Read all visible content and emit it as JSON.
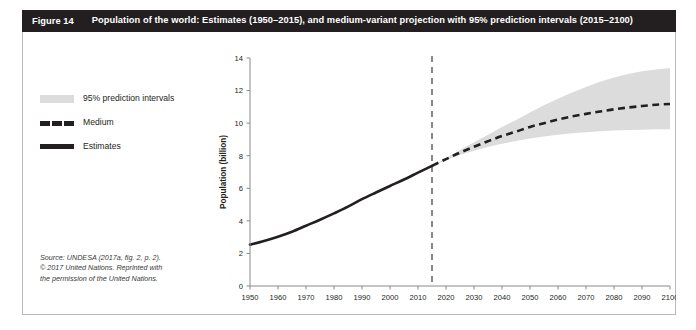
{
  "figure": {
    "number_label": "Figure 14",
    "title": "Population of the world: Estimates (1950–2015), and medium-variant projection with 95% prediction intervals (2015–2100)"
  },
  "legend": {
    "items": [
      {
        "key": "band",
        "label": "95% prediction intervals",
        "swatch": "filled-rectangle",
        "color": "#dcdcdc"
      },
      {
        "key": "medium",
        "label": "Medium",
        "swatch": "dashed-line",
        "color": "#231f20"
      },
      {
        "key": "estimates",
        "label": "Estimates",
        "swatch": "solid-line",
        "color": "#231f20"
      }
    ]
  },
  "source_note": {
    "line1": "Source: UNDESA (2017a, fig. 2, p. 2).",
    "line2": "© 2017 United Nations. Reprinted with",
    "line3": "the permission of the United Nations."
  },
  "chart_data": {
    "type": "line",
    "title": "",
    "xlabel": "",
    "ylabel": "Population (billion)",
    "xlim": [
      1950,
      2100
    ],
    "ylim": [
      0,
      14
    ],
    "xticks": [
      1950,
      1960,
      1970,
      1980,
      1990,
      2000,
      2010,
      2020,
      2030,
      2040,
      2050,
      2060,
      2070,
      2080,
      2090,
      2100
    ],
    "yticks": [
      0,
      2,
      4,
      6,
      8,
      10,
      12,
      14
    ],
    "xtick_labels": [
      "1950",
      "1960",
      "1970",
      "1980",
      "1990",
      "2000",
      "2010",
      "2020",
      "2030",
      "2040",
      "2050",
      "2060",
      "2070",
      "2080",
      "2090",
      "2100"
    ],
    "ytick_labels": [
      "0",
      "2",
      "4",
      "6",
      "8",
      "10",
      "12",
      "14"
    ],
    "grid": false,
    "legend_position": "outside-left",
    "annotations": [
      {
        "type": "vertical-dashed-line",
        "x": 2015,
        "label": "",
        "color": "#6b6b6b"
      }
    ],
    "series": [
      {
        "name": "Estimates",
        "style": "solid",
        "color": "#231f20",
        "x": [
          1950,
          1955,
          1960,
          1965,
          1970,
          1975,
          1980,
          1985,
          1990,
          1995,
          2000,
          2005,
          2010,
          2015
        ],
        "values": [
          2.54,
          2.77,
          3.03,
          3.33,
          3.7,
          4.07,
          4.46,
          4.87,
          5.33,
          5.74,
          6.14,
          6.54,
          6.96,
          7.38
        ]
      },
      {
        "name": "Medium",
        "style": "dashed",
        "color": "#231f20",
        "x": [
          2015,
          2020,
          2025,
          2030,
          2035,
          2040,
          2045,
          2050,
          2055,
          2060,
          2065,
          2070,
          2075,
          2080,
          2085,
          2090,
          2095,
          2100
        ],
        "values": [
          7.38,
          7.79,
          8.19,
          8.55,
          8.89,
          9.21,
          9.48,
          9.77,
          10.0,
          10.22,
          10.41,
          10.57,
          10.71,
          10.85,
          10.96,
          11.05,
          11.13,
          11.18
        ]
      },
      {
        "name": "95% prediction intervals upper",
        "style": "band-upper",
        "color": "#dcdcdc",
        "x": [
          2015,
          2020,
          2025,
          2030,
          2035,
          2040,
          2045,
          2050,
          2055,
          2060,
          2065,
          2070,
          2075,
          2080,
          2085,
          2090,
          2095,
          2100
        ],
        "values": [
          7.38,
          7.86,
          8.35,
          8.82,
          9.29,
          9.76,
          10.2,
          10.66,
          11.1,
          11.5,
          11.88,
          12.22,
          12.54,
          12.8,
          13.02,
          13.18,
          13.3,
          13.38
        ]
      },
      {
        "name": "95% prediction intervals lower",
        "style": "band-lower",
        "color": "#dcdcdc",
        "x": [
          2015,
          2020,
          2025,
          2030,
          2035,
          2040,
          2045,
          2050,
          2055,
          2060,
          2065,
          2070,
          2075,
          2080,
          2085,
          2090,
          2095,
          2100
        ],
        "values": [
          7.38,
          7.72,
          8.04,
          8.3,
          8.53,
          8.74,
          8.9,
          9.06,
          9.18,
          9.28,
          9.38,
          9.44,
          9.5,
          9.55,
          9.58,
          9.6,
          9.62,
          9.63
        ]
      }
    ]
  }
}
